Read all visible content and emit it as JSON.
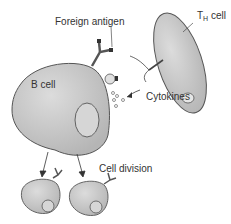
{
  "labels": {
    "foreign_antigen": "Foreign antigen",
    "th_cell_main": "T",
    "th_cell_sub": "H",
    "th_cell_suffix": " cell",
    "b_cell": "B cell",
    "cytokines": "Cytokines",
    "cell_division": "Cell division"
  },
  "colors": {
    "cell_fill": "#c8c8c8",
    "cell_stroke": "#555555",
    "nucleus_fill": "#d8d8d8",
    "text": "#333333"
  }
}
